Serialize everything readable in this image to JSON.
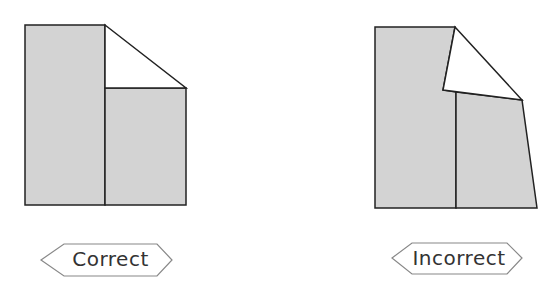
{
  "diagram": {
    "colors": {
      "fill": "#d3d3d3",
      "stroke": "#222222",
      "label_border": "#888888"
    },
    "figures": [
      {
        "id": "correct",
        "label": "Correct"
      },
      {
        "id": "incorrect",
        "label": "Incorrect"
      }
    ]
  }
}
